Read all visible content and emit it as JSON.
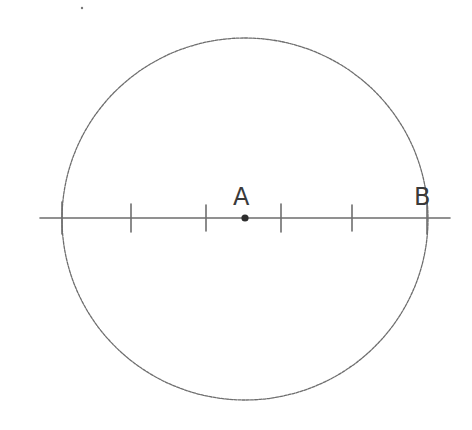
{
  "diagram": {
    "type": "number-line-in-circle",
    "style": "hand-drawn pencil sketch",
    "stroke_color": "#6e6e6e",
    "label_color": "#3a3a3a",
    "circle": {
      "cx": 245,
      "cy": 219,
      "rx": 183,
      "ry": 181
    },
    "axis": {
      "x1": 40,
      "x2": 450,
      "y": 218
    },
    "ticks": [
      {
        "x": 62,
        "half_height": 16
      },
      {
        "x": 131,
        "half_height": 14
      },
      {
        "x": 206,
        "half_height": 13
      },
      {
        "x": 281,
        "half_height": 14
      },
      {
        "x": 352,
        "half_height": 13
      },
      {
        "x": 427,
        "half_height": 16
      }
    ],
    "points": [
      {
        "id": "A",
        "label": "A",
        "x": 245,
        "y": 218,
        "label_x": 233,
        "label_y": 205,
        "dot": true
      },
      {
        "id": "B",
        "label": "B",
        "x": 427,
        "y": 218,
        "label_x": 414,
        "label_y": 205,
        "dot": false
      }
    ],
    "stray_mark": {
      "x": 82,
      "y": 8
    }
  }
}
